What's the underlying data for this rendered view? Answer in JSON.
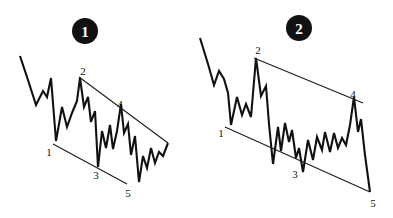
{
  "figure": {
    "background_color": "#ffffff",
    "ink_color": "#111111",
    "width": 393,
    "height": 218
  },
  "panels": [
    {
      "id": "panel-1",
      "badge": {
        "label": "1",
        "cx": 85,
        "cy": 31,
        "r": 13
      },
      "wave_labels": [
        {
          "name": "wave-label-1",
          "text": "1",
          "x": 49,
          "y": 152
        },
        {
          "name": "wave-label-2",
          "text": "2",
          "x": 83,
          "y": 71
        },
        {
          "name": "wave-label-3",
          "text": "3",
          "x": 96,
          "y": 175
        },
        {
          "name": "wave-label-4",
          "text": "4",
          "x": 120,
          "y": 104
        },
        {
          "name": "wave-label-5",
          "text": "5",
          "x": 128,
          "y": 193
        }
      ],
      "trendlines": [
        {
          "name": "upper-trendline",
          "x1": 79,
          "y1": 77,
          "x2": 168,
          "y2": 143
        },
        {
          "name": "lower-trendline",
          "x1": 53,
          "y1": 144,
          "x2": 127,
          "y2": 184
        }
      ],
      "price_path": "20,56 28,80 36,105 43,91 47,97 51,78 56,141 62,107 67,127 72,113 77,101 80,78 84,107 88,97 91,122 95,111 98,167 102,131 106,148 110,125 113,149 117,131 121,104 124,133 128,124 131,155 135,136 139,182 143,156 147,168 151,148 155,163 159,152 163,156 168,143"
    },
    {
      "id": "panel-2",
      "badge": {
        "label": "2",
        "cx": 299,
        "cy": 28,
        "r": 13
      },
      "wave_labels": [
        {
          "name": "wave-label-1",
          "text": "1",
          "x": 221,
          "y": 133
        },
        {
          "name": "wave-label-2",
          "text": "2",
          "x": 258,
          "y": 50
        },
        {
          "name": "wave-label-3",
          "text": "3",
          "x": 295,
          "y": 174
        },
        {
          "name": "wave-label-4",
          "text": "4",
          "x": 353,
          "y": 94
        },
        {
          "name": "wave-label-5",
          "text": "5",
          "x": 373,
          "y": 203
        },
        {
          "name": "wave-label-6",
          "text": "5",
          "x": 373,
          "y": 203
        }
      ],
      "trendlines": [
        {
          "name": "upper-trendline",
          "x1": 254,
          "y1": 58,
          "x2": 363,
          "y2": 103
        },
        {
          "name": "lower-trendline",
          "x1": 225,
          "y1": 127,
          "x2": 370,
          "y2": 192
        }
      ],
      "price_path": "200,38 208,64 214,85 219,71 224,79 228,93 231,125 237,97 242,115 246,104 251,117 256,58 261,96 266,86 269,124 273,164 278,127 281,151 285,123 289,142 292,130 296,158 299,148 303,172 308,140 313,160 317,137 322,150 325,132 330,152 334,133 338,148 342,138 346,145 350,125 354,97 358,132 361,119 365,155 370,192"
    }
  ]
}
